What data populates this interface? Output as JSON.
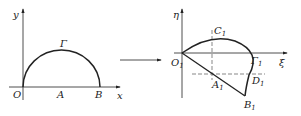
{
  "left_figure": {
    "axis_x_label": "x",
    "axis_y_label": "y",
    "origin_label": "O",
    "center_label": "A",
    "end_label": "B",
    "curve_label": "Γ"
  },
  "right_figure": {
    "axis_x_label": "ξ",
    "axis_y_label": "η",
    "origin_label": "O",
    "origin_sub": "1",
    "top_label": "C",
    "top_sub": "1",
    "center_label": "A",
    "center_sub": "1",
    "end_label": "B",
    "end_sub": "1",
    "side_label": "D",
    "side_sub": "1",
    "curve_label": "Γ",
    "curve_sub": "1"
  },
  "colors": {
    "line": "#222222",
    "dashed": "#555555"
  }
}
